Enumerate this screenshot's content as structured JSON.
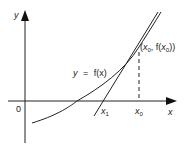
{
  "diagram": {
    "type": "newtons-method",
    "axes": {
      "x_label": "x",
      "y_label": "y",
      "origin_label": "0"
    },
    "curve_label": {
      "lhs": "y",
      "eq": "=",
      "rhs": "f(x)"
    },
    "point_label": "(x0, f(x0))",
    "point_label_parts": {
      "open": "(",
      "x": "x",
      "x_sub": "0",
      "sep": ", f(",
      "fx": "x",
      "fx_sub": "0",
      "close": "))"
    },
    "x_ticks": [
      {
        "name": "x",
        "sub": "1"
      },
      {
        "name": "x",
        "sub": "0"
      }
    ],
    "colors": {
      "stroke": "#222222",
      "background": "#ffffff"
    }
  }
}
